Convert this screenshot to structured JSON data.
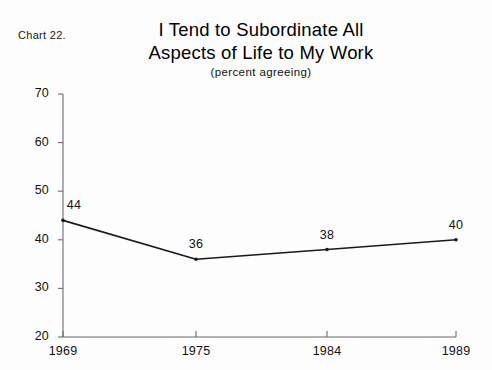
{
  "chart_number": "Chart 22.",
  "title_lines": [
    "I Tend to Subordinate All",
    "Aspects of Life to My Work"
  ],
  "subtitle": "(percent agreeing)",
  "chart_data": {
    "type": "line",
    "title": "I Tend to Subordinate All Aspects of Life to My Work",
    "subtitle": "(percent agreeing)",
    "xlabel": "",
    "ylabel": "",
    "categories": [
      "1969",
      "1975",
      "1984",
      "1989"
    ],
    "values": [
      44,
      36,
      38,
      40
    ],
    "point_labels": [
      "44",
      "36",
      "38",
      "40"
    ],
    "ylim": [
      20,
      70
    ],
    "yticks": [
      20,
      30,
      40,
      50,
      60,
      70
    ],
    "ytick_labels": [
      "20",
      "30",
      "40",
      "50",
      "60",
      "70"
    ],
    "xtick_labels": [
      "1969",
      "1975",
      "1984",
      "1989"
    ],
    "grid": false,
    "legend": "none",
    "series_color": "#1a1a1a",
    "axis_color": "#6b6b6b",
    "background_color": "#fdfdfd"
  }
}
